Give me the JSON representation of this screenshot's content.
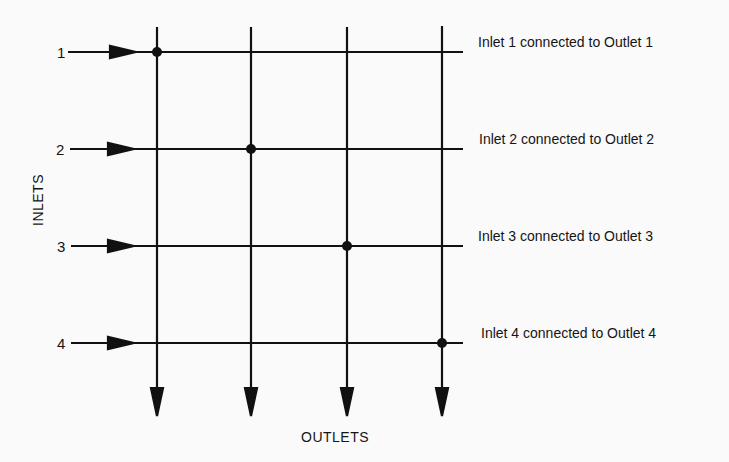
{
  "diagram": {
    "type": "crossbar-switch",
    "axis_labels": {
      "inlets": "INLETS",
      "outlets": "OUTLETS"
    },
    "inlets": [
      {
        "number": "1",
        "y": 52
      },
      {
        "number": "2",
        "y": 149
      },
      {
        "number": "3",
        "y": 246
      },
      {
        "number": "4",
        "y": 343
      }
    ],
    "outlets": [
      {
        "index": 1,
        "x": 157
      },
      {
        "index": 2,
        "x": 251
      },
      {
        "index": 3,
        "x": 347
      },
      {
        "index": 4,
        "x": 442
      }
    ],
    "connections": [
      {
        "inlet": 1,
        "outlet": 1,
        "label": "Inlet 1 connected to Outlet 1"
      },
      {
        "inlet": 2,
        "outlet": 2,
        "label": "Inlet 2 connected to Outlet 2"
      },
      {
        "inlet": 3,
        "outlet": 3,
        "label": "Inlet 3 connected to Outlet 3"
      },
      {
        "inlet": 4,
        "outlet": 4,
        "label": "Inlet 4 connected to Outlet 4"
      }
    ],
    "colors": {
      "line": "#111111",
      "background": "#fafafa"
    }
  }
}
